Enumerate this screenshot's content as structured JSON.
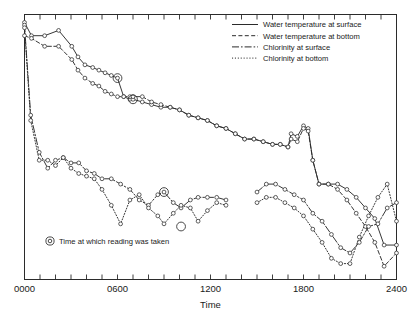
{
  "figure": {
    "background": "#ffffff",
    "ink": "#2b2b2b"
  },
  "chart_data": {
    "type": "line",
    "title": "",
    "subtitle": "",
    "xlabel": "Time",
    "ylabel": "",
    "xlim": [
      0,
      2400
    ],
    "ylim": [
      0,
      100
    ],
    "grid": false,
    "x_ticks_major": [
      0,
      600,
      1200,
      1800,
      2400
    ],
    "x_tick_labels": [
      "0000",
      "0600",
      "1200",
      "1800",
      "2400"
    ],
    "x_ticks_minor_step": 100,
    "y_ticks": [],
    "y_tick_labels": [],
    "legend_position": "top-right",
    "annotation": {
      "marker": "double-circle",
      "text": "Time at which reading was taken"
    },
    "series": [
      {
        "name": "Water temperature at surface",
        "style": "solid",
        "dasharray": "",
        "x": [
          0,
          45,
          130,
          220,
          305,
          345,
          390,
          440,
          480,
          520,
          560,
          600,
          640,
          680,
          700,
          760,
          820,
          880,
          940,
          1000,
          1060,
          1120,
          1180,
          1240,
          1300,
          1360,
          1420,
          1480,
          1540,
          1600,
          1650,
          1700,
          1720,
          1760,
          1800,
          1830,
          1860,
          1900,
          1960,
          2020,
          2080,
          2140,
          2200,
          2260,
          2320,
          2400
        ],
        "y": [
          97,
          92,
          92,
          94,
          88,
          84,
          81,
          80,
          79,
          78,
          77,
          76,
          69,
          68,
          68,
          67,
          66,
          65,
          65,
          64,
          62,
          61,
          60,
          58,
          57,
          55,
          53,
          53,
          52,
          51,
          51,
          50,
          55,
          54,
          58,
          57,
          45,
          36,
          36,
          36,
          34,
          31,
          27,
          23,
          13,
          13
        ]
      },
      {
        "name": "Water temperature at bottom",
        "style": "dashed",
        "dasharray": "4,2.4",
        "x": [
          0,
          45,
          130,
          220,
          305,
          345,
          390,
          440,
          480,
          520,
          560,
          600,
          640,
          680,
          700,
          760,
          820,
          880,
          940,
          1000,
          1060,
          1120,
          1180,
          1240,
          1300,
          1360,
          1420,
          1480,
          1540,
          1600,
          1650,
          1700,
          1720,
          1760,
          1800,
          1830,
          1860,
          1900,
          1960,
          2020,
          2080,
          2140,
          2200,
          2260,
          2320,
          2400
        ],
        "y": [
          92,
          91,
          88,
          88,
          83,
          79,
          76,
          74,
          73,
          71,
          70,
          69,
          69,
          69,
          69,
          69,
          67,
          66,
          65,
          64,
          62,
          61,
          60,
          58,
          57,
          55,
          53,
          53,
          52,
          51,
          51,
          50,
          53,
          52,
          57,
          56,
          45,
          36,
          36,
          34,
          30,
          25,
          20,
          14,
          5,
          10
        ]
      },
      {
        "name": "Chlorinity at surface",
        "style": "dashdot",
        "dasharray": "7,2,1.6,2",
        "segments": [
          {
            "x": [
              0,
              40,
              95,
              150,
              200,
              250,
              300,
              350,
              400,
              450,
              500,
              560,
              620,
              680,
              740,
              800,
              860,
              900,
              960,
              1010,
              1070,
              1120,
              1180,
              1240,
              1300
            ],
            "y": [
              96,
              62,
              48,
              42,
              45,
              46,
              44,
              44,
              41,
              40,
              38,
              38,
              36,
              34,
              30,
              28,
              32,
              33,
              29,
              27,
              30,
              31,
              31,
              31,
              30
            ]
          },
          {
            "x": [
              1500,
              1560,
              1620,
              1680,
              1740,
              1800,
              1860,
              1920,
              1980,
              2040,
              2100,
              2160,
              2220,
              2280,
              2340,
              2400
            ],
            "y": [
              33,
              36,
              36,
              34,
              32,
              30,
              25,
              22,
              17,
              12,
              10,
              14,
              20,
              21,
              27,
              29
            ]
          }
        ]
      },
      {
        "name": "Chlorinity at bottom",
        "style": "dotted",
        "dasharray": "1.1,1.8",
        "segments": [
          {
            "x": [
              0,
              40,
              95,
              150,
              200,
              250,
              300,
              350,
              400,
              450,
              500,
              560,
              620,
              680,
              740,
              800,
              860,
              900,
              960,
              1010,
              1070,
              1120,
              1180,
              1240,
              1300
            ],
            "y": [
              95,
              60,
              45,
              45,
              43,
              46,
              42,
              40,
              39,
              38,
              34,
              28,
              21,
              30,
              32,
              27,
              24,
              21,
              25,
              28,
              27,
              22,
              26,
              29,
              28
            ]
          },
          {
            "x": [
              1500,
              1560,
              1620,
              1680,
              1740,
              1800,
              1860,
              1920,
              1980,
              2040,
              2100,
              2160,
              2220,
              2280,
              2340,
              2400
            ],
            "y": [
              29,
              31,
              31,
              29,
              27,
              24,
              19,
              14,
              8,
              6,
              6,
              16,
              24,
              31,
              36,
              22
            ]
          }
        ]
      }
    ],
    "reading_markers": [
      {
        "x": 600,
        "y": 76,
        "series": "Water temperature at surface"
      },
      {
        "x": 700,
        "y": 68,
        "series": "Water temperature at surface"
      },
      {
        "x": 900,
        "y": 33,
        "series": "Chlorinity at surface"
      },
      {
        "x": 1010,
        "y": 20,
        "series": "Chlorinity at bottom"
      }
    ]
  },
  "legend": {
    "items": [
      {
        "label": "Water temperature at surface",
        "style": "solid"
      },
      {
        "label": "Water temperature at bottom",
        "style": "dashed"
      },
      {
        "label": "Chlorinity at surface",
        "style": "dashdot"
      },
      {
        "label": "Chlorinity at bottom",
        "style": "dotted"
      }
    ]
  }
}
